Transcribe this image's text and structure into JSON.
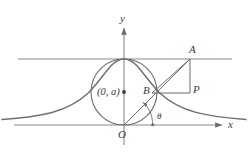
{
  "figure": {
    "background_color": "#ffffff",
    "stroke_color": "#6b6b6b",
    "curve_color": "#707070",
    "label_color": "#3a3a3a"
  },
  "axes": {
    "x_label": "x",
    "y_label": "y",
    "origin_label": "O",
    "x_axis_y": 125,
    "y_axis_x": 124,
    "x_axis_arrow": true,
    "y_axis_arrow": true
  },
  "asymptote": {
    "label": "",
    "y": 59,
    "description": "horizontal tangent line at y = 2a"
  },
  "circle": {
    "center_label": "(0, a)",
    "center_x": 124,
    "center_y": 92,
    "radius": 33,
    "center_dot": true
  },
  "points": [
    {
      "name": "A",
      "label": "A",
      "x": 190,
      "y": 59
    },
    {
      "name": "B",
      "label": "B",
      "x": 152,
      "y": 93
    },
    {
      "name": "P",
      "label": "P",
      "x": 190,
      "y": 93
    },
    {
      "name": "O",
      "label": "O",
      "x": 124,
      "y": 125
    }
  ],
  "angle": {
    "label": "θ",
    "vertex": "O",
    "arc_radius": 28,
    "measured_from": "x-axis"
  },
  "segments": [
    {
      "name": "OA",
      "from": "O",
      "to": "A"
    },
    {
      "name": "AP",
      "from": "A",
      "to": "P"
    },
    {
      "name": "BP",
      "from": "B",
      "to": "P"
    },
    {
      "name": "OB",
      "from": "O",
      "to": "B"
    },
    {
      "name": "BA-chord",
      "from": "B",
      "to": "A"
    }
  ],
  "curve": {
    "name": "witch-of-agnesi",
    "equation_hint": "y = 8a^3 / (x^2 + 4a^2)",
    "description": "bell-shaped curve peaking at the top of the circle and approaching the x-axis"
  }
}
